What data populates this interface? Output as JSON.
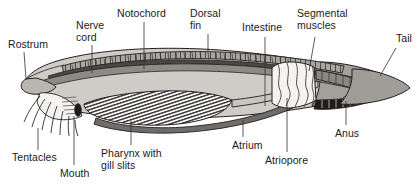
{
  "figure": {
    "orientation": "left-anterior-right-posterior",
    "background_color": "#ffffff",
    "ink_color": "#1a1a1a"
  },
  "palette": {
    "outline": "#231f20",
    "body_light_gray": "#d5d2cd",
    "body_mid_gray": "#b6b3ae",
    "body_dark_gray": "#7c7a76",
    "notochord_gray": "#908d88",
    "nerve_cord_dark": "#4a4845",
    "fin_gray": "#9b9894",
    "atrium_gray": "#6f6d69",
    "muscle_white": "#f2f1ee",
    "tail_gray": "#a3a09b",
    "hatch_dark": "#3a3836",
    "white": "#ffffff"
  },
  "labels": [
    {
      "id": "rostrum",
      "text": "Rostrum",
      "lines": [
        "Rostrum"
      ],
      "x": 8,
      "y": 38,
      "align": "left"
    },
    {
      "id": "nerve-cord",
      "text": "Nerve cord",
      "lines": [
        "Nerve",
        "cord"
      ],
      "x": 76,
      "y": 19,
      "align": "left"
    },
    {
      "id": "notochord",
      "text": "Notochord",
      "lines": [
        "Notochord"
      ],
      "x": 117,
      "y": 7,
      "align": "left"
    },
    {
      "id": "dorsal-fin",
      "text": "Dorsal fin",
      "lines": [
        "Dorsal",
        "fin"
      ],
      "x": 190,
      "y": 7,
      "align": "left"
    },
    {
      "id": "intestine",
      "text": "Intestine",
      "lines": [
        "Intestine"
      ],
      "x": 242,
      "y": 21,
      "align": "left"
    },
    {
      "id": "segmental-muscles",
      "text": "Segmental muscles",
      "lines": [
        "Segmental",
        "muscles"
      ],
      "x": 297,
      "y": 7,
      "align": "left"
    },
    {
      "id": "tail",
      "text": "Tail",
      "lines": [
        "Tail"
      ],
      "x": 396,
      "y": 32,
      "align": "left"
    },
    {
      "id": "tentacles",
      "text": "Tentacles",
      "lines": [
        "Tentacles"
      ],
      "x": 12,
      "y": 151,
      "align": "left"
    },
    {
      "id": "mouth",
      "text": "Mouth",
      "lines": [
        "Mouth"
      ],
      "x": 60,
      "y": 167,
      "align": "left"
    },
    {
      "id": "pharynx-with-gill-slits",
      "text": "Pharynx with gill slits",
      "lines": [
        "Pharynx with",
        "gill slits"
      ],
      "x": 101,
      "y": 147,
      "align": "left"
    },
    {
      "id": "atrium",
      "text": "Atrium",
      "lines": [
        "Atrium"
      ],
      "x": 232,
      "y": 139,
      "align": "left"
    },
    {
      "id": "atriopore",
      "text": "Atriopore",
      "lines": [
        "Atriopore"
      ],
      "x": 265,
      "y": 154,
      "align": "left"
    },
    {
      "id": "anus",
      "text": "Anus",
      "lines": [
        "Anus"
      ],
      "x": 335,
      "y": 127,
      "align": "left"
    }
  ],
  "leader_lines": [
    {
      "id": "rostrum-leader",
      "points": "24,52 26,79"
    },
    {
      "id": "nerve-cord-leader",
      "points": "92,45 92,73"
    },
    {
      "id": "notochord-leader",
      "points": "144,22 144,69"
    },
    {
      "id": "dorsal-fin-leader",
      "points": "208,34 208,52"
    },
    {
      "id": "intestine-leader",
      "points": "265,37 265,106"
    },
    {
      "id": "segmental-muscles-leader",
      "points": "315,37 309,71"
    },
    {
      "id": "tail-leader",
      "points": "396,48 380,76"
    },
    {
      "id": "tentacles-leader",
      "points": "38,128 38,150"
    },
    {
      "id": "mouth-leader",
      "points": "74,116 74,165"
    },
    {
      "id": "pharynx-leader",
      "points": "131,121 131,145"
    },
    {
      "id": "atrium-leader",
      "points": "243,120 243,137"
    },
    {
      "id": "atriopore-leader",
      "points": "287,98 287,152"
    },
    {
      "id": "anus-leader",
      "points": "346,101 346,125"
    }
  ],
  "structures": [
    {
      "id": "rostrum",
      "name": "Rostrum"
    },
    {
      "id": "nerve-cord",
      "name": "Nerve cord"
    },
    {
      "id": "notochord",
      "name": "Notochord"
    },
    {
      "id": "dorsal-fin",
      "name": "Dorsal fin"
    },
    {
      "id": "intestine",
      "name": "Intestine"
    },
    {
      "id": "segmental-muscles",
      "name": "Segmental muscles"
    },
    {
      "id": "tail",
      "name": "Tail"
    },
    {
      "id": "tentacles",
      "name": "Tentacles"
    },
    {
      "id": "mouth",
      "name": "Mouth"
    },
    {
      "id": "pharynx",
      "name": "Pharynx with gill slits"
    },
    {
      "id": "atrium",
      "name": "Atrium"
    },
    {
      "id": "atriopore",
      "name": "Atriopore"
    },
    {
      "id": "anus",
      "name": "Anus"
    }
  ]
}
